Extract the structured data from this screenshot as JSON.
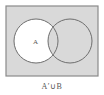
{
  "diagram": {
    "type": "venn",
    "caption": "A′∪B",
    "shaded_region": "A′∪B",
    "universe": {
      "x": 6,
      "y": 6,
      "width": 92,
      "height": 70,
      "fill": "#d9d9d9",
      "stroke": "#8a8a8a"
    },
    "sets": [
      {
        "name": "A",
        "label": "A",
        "cx": 36,
        "cy": 41,
        "r": 22,
        "stroke": "#6e6e6e"
      },
      {
        "name": "B",
        "label": "",
        "cx": 70,
        "cy": 41,
        "r": 22,
        "stroke": "#6e6e6e"
      }
    ],
    "colors": {
      "shade": "#d9d9d9",
      "unshaded": "#ffffff",
      "outline": "#6e6e6e"
    }
  }
}
